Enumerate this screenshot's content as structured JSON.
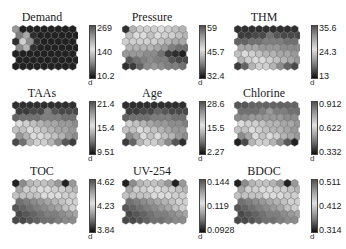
{
  "chart_data": {
    "type": "heatmap",
    "title": "",
    "layout": {
      "rows": 3,
      "cols": 3,
      "map_grid": {
        "rows": 7,
        "cols": 9,
        "shape": "hexagon"
      },
      "colormap": "grayscale (dark=low, light=mid, dark-gray=high)"
    },
    "panels": [
      {
        "name": "Demand",
        "colorbar": {
          "max": "269",
          "mid": "140",
          "min": "10.2"
        },
        "unit_label": "d",
        "values": [
          [
            0.5,
            0.05,
            0.05,
            0.05,
            0.05,
            0.05,
            0.05,
            0.05,
            0.05
          ],
          [
            0.4,
            0.85,
            0.1,
            0.05,
            0.05,
            0.05,
            0.05,
            0.05,
            0.05
          ],
          [
            0.1,
            0.7,
            0.9,
            0.1,
            0.05,
            0.05,
            0.05,
            0.05,
            0.05
          ],
          [
            0.45,
            0.6,
            0.1,
            0.05,
            0.05,
            0.05,
            0.05,
            0.05,
            0.05
          ],
          [
            0.05,
            0.05,
            0.05,
            0.05,
            0.05,
            0.05,
            0.05,
            0.05,
            0.05
          ],
          [
            0.05,
            0.05,
            0.05,
            0.05,
            0.05,
            0.05,
            0.05,
            0.05,
            0.05
          ],
          [
            0.05,
            0.05,
            0.05,
            0.05,
            0.05,
            0.05,
            0.05,
            0.05,
            0.05
          ]
        ]
      },
      {
        "name": "Pressure",
        "colorbar": {
          "max": "59",
          "mid": "45.7",
          "min": "32.4"
        },
        "unit_label": "d",
        "values": [
          [
            0.1,
            0.6,
            0.7,
            0.7,
            0.7,
            0.75,
            0.7,
            0.65,
            0.6
          ],
          [
            0.65,
            0.75,
            0.75,
            0.8,
            0.75,
            0.7,
            0.7,
            0.65,
            0.6
          ],
          [
            0.7,
            0.7,
            0.7,
            0.7,
            0.7,
            0.65,
            0.6,
            0.55,
            0.55
          ],
          [
            0.6,
            0.6,
            0.6,
            0.6,
            0.55,
            0.5,
            0.4,
            0.35,
            0.35
          ],
          [
            0.5,
            0.5,
            0.5,
            0.45,
            0.45,
            0.35,
            0.15,
            0.1,
            0.05
          ],
          [
            0.25,
            0.35,
            0.4,
            0.45,
            0.4,
            0.4,
            0.25,
            0.2,
            0.2
          ],
          [
            0.1,
            0.15,
            0.3,
            0.45,
            0.5,
            0.45,
            0.4,
            0.4,
            0.35
          ]
        ]
      },
      {
        "name": "THM",
        "colorbar": {
          "max": "35.6",
          "mid": "24.3",
          "min": "13"
        },
        "unit_label": "d",
        "values": [
          [
            0.1,
            0.1,
            0.1,
            0.1,
            0.1,
            0.1,
            0.1,
            0.1,
            0.1
          ],
          [
            0.15,
            0.15,
            0.2,
            0.2,
            0.35,
            0.25,
            0.2,
            0.2,
            0.2
          ],
          [
            0.3,
            0.3,
            0.35,
            0.35,
            0.4,
            0.4,
            0.4,
            0.35,
            0.35
          ],
          [
            0.55,
            0.55,
            0.55,
            0.5,
            0.5,
            0.5,
            0.45,
            0.45,
            0.45
          ],
          [
            0.8,
            0.75,
            0.7,
            0.65,
            0.6,
            0.6,
            0.55,
            0.55,
            0.5
          ],
          [
            0.6,
            0.7,
            0.75,
            0.75,
            0.7,
            0.65,
            0.6,
            0.55,
            0.5
          ],
          [
            0.15,
            0.3,
            0.6,
            0.7,
            0.7,
            0.6,
            0.45,
            0.3,
            0.2
          ]
        ]
      },
      {
        "name": "TAAs",
        "colorbar": {
          "max": "21.4",
          "mid": "15.4",
          "min": "9.51"
        },
        "unit_label": "d",
        "values": [
          [
            0.1,
            0.1,
            0.1,
            0.1,
            0.1,
            0.1,
            0.1,
            0.1,
            0.1
          ],
          [
            0.15,
            0.15,
            0.2,
            0.2,
            0.4,
            0.25,
            0.2,
            0.2,
            0.2
          ],
          [
            0.3,
            0.35,
            0.35,
            0.35,
            0.4,
            0.4,
            0.4,
            0.35,
            0.35
          ],
          [
            0.75,
            0.7,
            0.65,
            0.6,
            0.55,
            0.55,
            0.5,
            0.5,
            0.45
          ],
          [
            0.8,
            0.8,
            0.75,
            0.7,
            0.65,
            0.6,
            0.55,
            0.55,
            0.5
          ],
          [
            0.5,
            0.6,
            0.75,
            0.75,
            0.7,
            0.65,
            0.6,
            0.5,
            0.45
          ],
          [
            0.2,
            0.35,
            0.6,
            0.7,
            0.7,
            0.6,
            0.45,
            0.25,
            0.15
          ]
        ]
      },
      {
        "name": "Age",
        "colorbar": {
          "max": "28.6",
          "mid": "15.5",
          "min": "2.27"
        },
        "unit_label": "d",
        "values": [
          [
            0.1,
            0.1,
            0.1,
            0.1,
            0.1,
            0.1,
            0.1,
            0.1,
            0.1
          ],
          [
            0.15,
            0.15,
            0.2,
            0.2,
            0.3,
            0.25,
            0.2,
            0.2,
            0.2
          ],
          [
            0.3,
            0.35,
            0.35,
            0.35,
            0.4,
            0.4,
            0.4,
            0.35,
            0.35
          ],
          [
            0.7,
            0.65,
            0.6,
            0.55,
            0.5,
            0.5,
            0.45,
            0.45,
            0.4
          ],
          [
            0.8,
            0.8,
            0.75,
            0.7,
            0.65,
            0.6,
            0.55,
            0.5,
            0.5
          ],
          [
            0.45,
            0.55,
            0.75,
            0.8,
            0.75,
            0.65,
            0.6,
            0.5,
            0.45
          ],
          [
            0.15,
            0.3,
            0.6,
            0.7,
            0.7,
            0.6,
            0.45,
            0.25,
            0.1
          ]
        ]
      },
      {
        "name": "Chlorine",
        "colorbar": {
          "max": "0.912",
          "mid": "0.622",
          "min": "0.332"
        },
        "unit_label": "d",
        "values": [
          [
            0.25,
            0.25,
            0.3,
            0.3,
            0.3,
            0.3,
            0.3,
            0.3,
            0.3
          ],
          [
            0.35,
            0.35,
            0.35,
            0.4,
            0.5,
            0.4,
            0.4,
            0.35,
            0.35
          ],
          [
            0.45,
            0.45,
            0.5,
            0.5,
            0.5,
            0.5,
            0.5,
            0.45,
            0.45
          ],
          [
            0.75,
            0.7,
            0.7,
            0.65,
            0.6,
            0.6,
            0.55,
            0.55,
            0.5
          ],
          [
            0.8,
            0.8,
            0.75,
            0.7,
            0.65,
            0.6,
            0.6,
            0.55,
            0.5
          ],
          [
            0.45,
            0.55,
            0.75,
            0.8,
            0.75,
            0.7,
            0.6,
            0.55,
            0.5
          ],
          [
            0.05,
            0.2,
            0.6,
            0.7,
            0.7,
            0.6,
            0.45,
            0.25,
            0.05
          ]
        ]
      },
      {
        "name": "TOC",
        "colorbar": {
          "max": "4.62",
          "mid": "4.23",
          "min": "3.84"
        },
        "unit_label": "d",
        "values": [
          [
            0.05,
            0.45,
            0.6,
            0.65,
            0.65,
            0.6,
            0.5,
            0.05,
            0.5
          ],
          [
            0.55,
            0.7,
            0.7,
            0.75,
            0.75,
            0.7,
            0.7,
            0.65,
            0.6
          ],
          [
            0.8,
            0.8,
            0.8,
            0.8,
            0.75,
            0.75,
            0.75,
            0.7,
            0.7
          ],
          [
            0.35,
            0.4,
            0.45,
            0.5,
            0.55,
            0.6,
            0.65,
            0.7,
            0.7
          ],
          [
            0.25,
            0.3,
            0.35,
            0.4,
            0.45,
            0.5,
            0.55,
            0.65,
            0.7
          ],
          [
            0.2,
            0.25,
            0.3,
            0.35,
            0.4,
            0.4,
            0.45,
            0.5,
            0.55
          ],
          [
            0.2,
            0.2,
            0.25,
            0.3,
            0.35,
            0.35,
            0.4,
            0.45,
            0.45
          ]
        ]
      },
      {
        "name": "UV-254",
        "colorbar": {
          "max": "0.144",
          "mid": "0.119",
          "min": "0.0928"
        },
        "unit_label": "d",
        "values": [
          [
            0.05,
            0.45,
            0.6,
            0.65,
            0.65,
            0.6,
            0.5,
            0.05,
            0.5
          ],
          [
            0.55,
            0.7,
            0.7,
            0.75,
            0.75,
            0.7,
            0.7,
            0.65,
            0.6
          ],
          [
            0.8,
            0.8,
            0.8,
            0.8,
            0.75,
            0.75,
            0.75,
            0.7,
            0.7
          ],
          [
            0.35,
            0.4,
            0.45,
            0.5,
            0.55,
            0.6,
            0.65,
            0.7,
            0.7
          ],
          [
            0.25,
            0.3,
            0.35,
            0.4,
            0.45,
            0.5,
            0.55,
            0.65,
            0.7
          ],
          [
            0.2,
            0.25,
            0.3,
            0.35,
            0.4,
            0.4,
            0.45,
            0.5,
            0.55
          ],
          [
            0.2,
            0.2,
            0.25,
            0.3,
            0.35,
            0.35,
            0.4,
            0.45,
            0.45
          ]
        ]
      },
      {
        "name": "BDOC",
        "colorbar": {
          "max": "0.511",
          "mid": "0.412",
          "min": "0.314"
        },
        "unit_label": "d",
        "values": [
          [
            0.05,
            0.45,
            0.6,
            0.65,
            0.65,
            0.6,
            0.5,
            0.05,
            0.5
          ],
          [
            0.55,
            0.7,
            0.7,
            0.75,
            0.75,
            0.7,
            0.7,
            0.65,
            0.6
          ],
          [
            0.8,
            0.8,
            0.8,
            0.8,
            0.75,
            0.75,
            0.75,
            0.7,
            0.7
          ],
          [
            0.35,
            0.4,
            0.45,
            0.5,
            0.55,
            0.6,
            0.65,
            0.7,
            0.7
          ],
          [
            0.25,
            0.3,
            0.35,
            0.4,
            0.45,
            0.5,
            0.55,
            0.65,
            0.7
          ],
          [
            0.2,
            0.25,
            0.3,
            0.35,
            0.4,
            0.4,
            0.45,
            0.5,
            0.55
          ],
          [
            0.2,
            0.2,
            0.25,
            0.3,
            0.35,
            0.35,
            0.4,
            0.45,
            0.45
          ]
        ]
      }
    ]
  }
}
